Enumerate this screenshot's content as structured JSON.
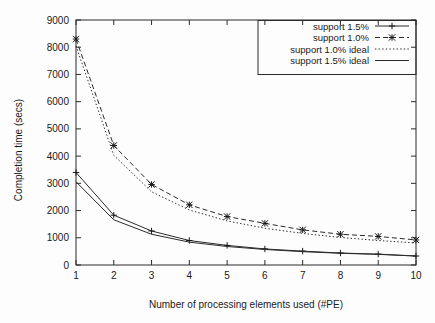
{
  "chart_data": {
    "type": "line",
    "title": "",
    "xlabel": "Number of processing elements used (#PE)",
    "ylabel": "Completion time (secs)",
    "x": [
      1,
      2,
      3,
      4,
      5,
      6,
      7,
      8,
      9,
      10
    ],
    "xlim": [
      1,
      10
    ],
    "ylim": [
      0,
      9000
    ],
    "xticks": [
      "1",
      "2",
      "3",
      "4",
      "5",
      "6",
      "7",
      "8",
      "9",
      "10"
    ],
    "yticks": [
      "0",
      "1000",
      "2000",
      "3000",
      "4000",
      "5000",
      "6000",
      "7000",
      "8000",
      "9000"
    ],
    "grid": false,
    "legend_position": "top-right",
    "series": [
      {
        "name": "support 1.5%",
        "style": "solid",
        "marker": "plus",
        "color": "#2b2b2b",
        "values": [
          3400,
          1830,
          1250,
          900,
          720,
          590,
          510,
          440,
          400,
          330
        ]
      },
      {
        "name": "support 1.0%",
        "style": "dashed",
        "marker": "cross",
        "color": "#2b2b2b",
        "values": [
          8300,
          4390,
          2960,
          2210,
          1780,
          1530,
          1290,
          1130,
          1050,
          920
        ]
      },
      {
        "name": "support 1.0% ideal",
        "style": "dotted",
        "marker": "none",
        "color": "#2b2b2b",
        "values": [
          8050,
          4030,
          2690,
          2020,
          1620,
          1350,
          1160,
          1010,
          900,
          810
        ]
      },
      {
        "name": "support 1.5% ideal",
        "style": "solid",
        "marker": "none",
        "color": "#6b6b6b",
        "values": [
          3060,
          1660,
          1130,
          840,
          680,
          570,
          490,
          430,
          390,
          330
        ]
      }
    ]
  },
  "legend": {
    "entries": [
      {
        "label": "support 1.5%"
      },
      {
        "label": "support 1.0%"
      },
      {
        "label": "support 1.0% ideal"
      },
      {
        "label": "support 1.5% ideal"
      }
    ]
  }
}
